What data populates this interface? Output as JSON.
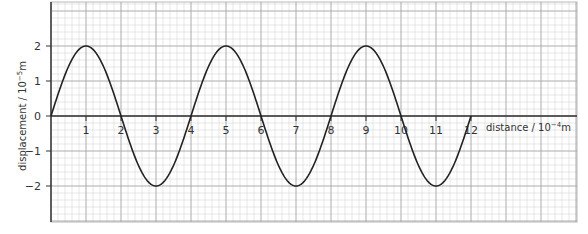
{
  "chart_data": {
    "type": "line",
    "title": "",
    "xlabel": "distance / 10^-4 m",
    "ylabel": "displacement / 10^-5 m",
    "xlabel_parts": {
      "main": "distance / 10",
      "exp": "−4",
      "unit": "m"
    },
    "ylabel_parts": {
      "main": "displacement / 10",
      "exp": "−5",
      "unit": "m"
    },
    "xlim": [
      0,
      15
    ],
    "ylim": [
      -3,
      3
    ],
    "grid": true,
    "grid_minor_step": 0.2,
    "grid_major_step": 1,
    "x_ticks": [
      1,
      2,
      3,
      4,
      5,
      6,
      7,
      8,
      9,
      10,
      11,
      12
    ],
    "y_ticks": [
      2,
      1,
      0,
      -1,
      -2
    ],
    "y_tick_labels": [
      "2",
      "1",
      "0",
      "−1",
      "−2"
    ],
    "series": [
      {
        "name": "wave",
        "function": "2*sin(pi*x/2)",
        "amplitude": 2,
        "wavelength": 4,
        "x_start": 0,
        "x_end": 12,
        "points": [
          [
            0,
            0
          ],
          [
            1,
            2
          ],
          [
            2,
            0
          ],
          [
            3,
            -2
          ],
          [
            4,
            0
          ],
          [
            5,
            2
          ],
          [
            6,
            0
          ],
          [
            7,
            -2
          ],
          [
            8,
            0
          ],
          [
            9,
            2
          ],
          [
            10,
            0
          ],
          [
            11,
            -2
          ],
          [
            12,
            0
          ]
        ],
        "color": "#222222"
      }
    ],
    "colors": {
      "grid_minor": "#d6d6d6",
      "grid_major": "#a8a8a8",
      "axis": "#333333",
      "curve": "#222222"
    }
  }
}
